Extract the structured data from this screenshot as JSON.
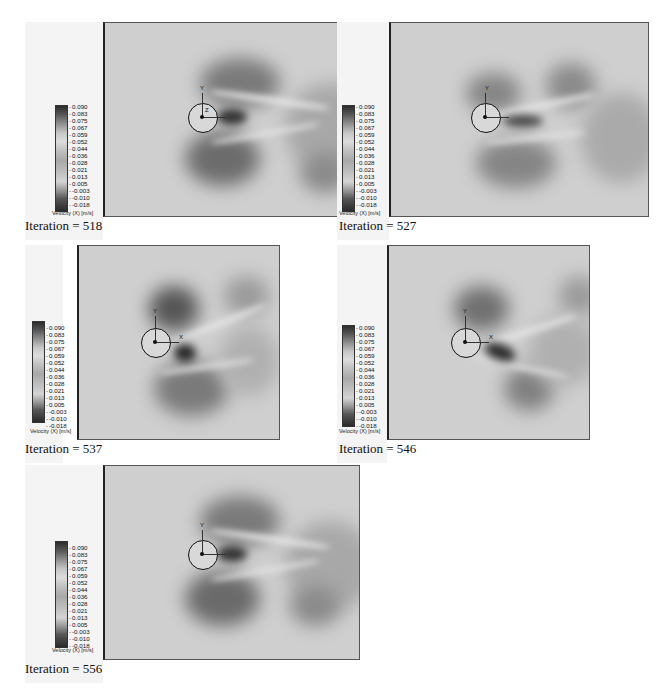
{
  "figure": {
    "panels": [
      {
        "caption": "Iteration = 518",
        "iteration": 518
      },
      {
        "caption": "Iteration = 527",
        "iteration": 527
      },
      {
        "caption": "Iteration = 537",
        "iteration": 537
      },
      {
        "caption": "Iteration = 546",
        "iteration": 546
      },
      {
        "caption": "Iteration = 556",
        "iteration": 556
      }
    ],
    "colorbar": {
      "label": "Velocity (X) [m/s]",
      "ticks": [
        "0.090",
        "0.083",
        "0.075",
        "0.067",
        "0.059",
        "0.052",
        "0.044",
        "0.036",
        "0.028",
        "0.021",
        "0.013",
        "0.005",
        "-0.003",
        "-0.010",
        "-0.018"
      ]
    },
    "axes_labels": {
      "x": "X",
      "y": "Y",
      "z": "Z"
    }
  }
}
